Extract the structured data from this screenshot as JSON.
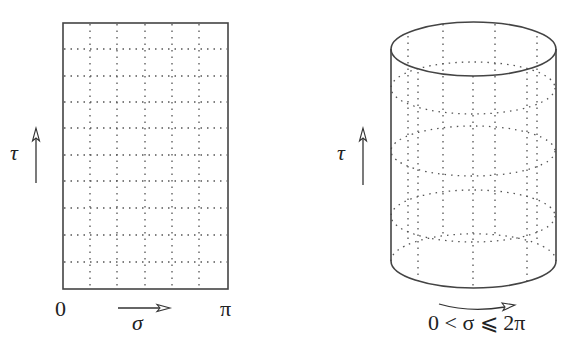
{
  "open_string": {
    "time_label": "τ",
    "space_label": "σ",
    "left_endpoint": "0",
    "right_endpoint": "π",
    "shape": "rectangle worldsheet",
    "grid_columns": 6,
    "grid_rows": 10
  },
  "closed_string": {
    "time_label": "τ",
    "range_label": "0 < σ ⩽ 2π",
    "shape": "cylinder worldsheet"
  },
  "colors": {
    "stroke": "#444444",
    "grid": "#555555",
    "background": "#ffffff"
  }
}
